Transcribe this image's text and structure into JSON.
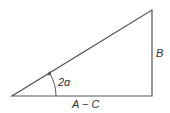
{
  "diagram": {
    "type": "right-triangle",
    "labels": {
      "angle": "2α",
      "vertical_side": "B",
      "horizontal_side": "A − C"
    },
    "colors": {
      "stroke": "#555555",
      "text": "#333333",
      "background": "#ffffff"
    }
  }
}
